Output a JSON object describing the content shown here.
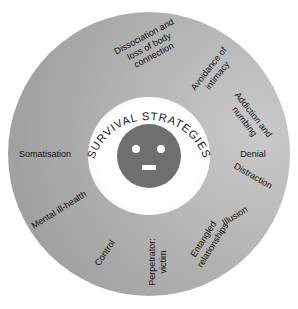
{
  "figure": {
    "type": "radial-wheel-diagram",
    "center_label": "SURVIVAL STRATEGIES",
    "face": {
      "eye_left": "eye",
      "eye_right": "eye",
      "mouth": "mouth"
    },
    "colors": {
      "disc_dark": "#898989",
      "disc_light": "#c9c9c9",
      "ring": "#ffffff",
      "face": "#6f6f6f",
      "face_feature": "#ffffff",
      "text": "#111111",
      "background": "#ffffff"
    },
    "spokes": [
      {
        "id": "avoidance-of-intimacy",
        "lines": [
          "Avoidance of",
          "intimacy"
        ],
        "angle": -52,
        "radius": 104,
        "rotation": -52
      },
      {
        "id": "addiction-and-numbing",
        "lines": [
          "Addiction and",
          "numbing"
        ],
        "angle": -20,
        "radius": 106,
        "rotation": 52
      },
      {
        "id": "dissociation-and-loss-of-body-connection",
        "lines": [
          "Dissociation and",
          "loss of body",
          "connection"
        ],
        "angle": -90,
        "radius": 108,
        "rotation": -28
      },
      {
        "id": "distraction",
        "lines": [
          "Distraction"
        ],
        "angle": 12,
        "radius": 106,
        "rotation": 30
      },
      {
        "id": "somatisation",
        "lines": [
          "Somatisation"
        ],
        "angle": 180,
        "radius": 104,
        "rotation": 0
      },
      {
        "id": "denial",
        "lines": [
          "Denial"
        ],
        "angle": 0,
        "radius": 104,
        "rotation": 0
      },
      {
        "id": "mental-ill-health",
        "lines": [
          "Mental ill-health"
        ],
        "angle": 148,
        "radius": 106,
        "rotation": -32
      },
      {
        "id": "illusion",
        "lines": [
          "Illusion"
        ],
        "angle": 36,
        "radius": 106,
        "rotation": -32
      },
      {
        "id": "control",
        "lines": [
          "Control"
        ],
        "angle": 114,
        "radius": 108,
        "rotation": -56
      },
      {
        "id": "entangled-relationships",
        "lines": [
          "Entangled",
          "relationships"
        ],
        "angle": 56,
        "radius": 106,
        "rotation": -58
      },
      {
        "id": "perpetrator-victim",
        "lines": [
          "Perpetrator:",
          "victim"
        ],
        "angle": 86,
        "radius": 108,
        "rotation": -90
      }
    ]
  }
}
